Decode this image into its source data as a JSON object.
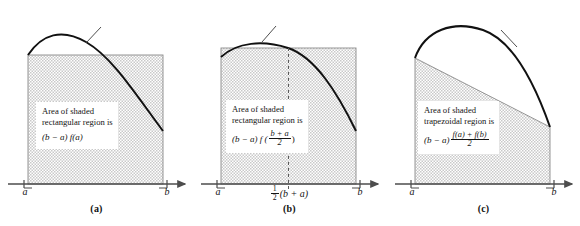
{
  "figure": {
    "curve_label": "y = f(x)",
    "panels": [
      {
        "id": "a",
        "caption": "(a)",
        "method": "left-endpoint rectangle rule",
        "callout": {
          "line1": "Area of shaded",
          "line2": "rectangular region is",
          "formula_text": "(b − a) f(a)",
          "formula": {
            "lead": "(b − a) f(a)"
          }
        },
        "axis_labels": {
          "left": "a",
          "right": "b"
        }
      },
      {
        "id": "b",
        "caption": "(b)",
        "method": "midpoint rectangle rule",
        "callout": {
          "line1": "Area of shaded",
          "line2": "rectangular region is",
          "formula_text": "(b − a) f((b + a)/2)",
          "formula": {
            "lead": "(b − a) f (",
            "numerator": "b + a",
            "denominator": "2",
            "trail": ")"
          }
        },
        "axis_labels": {
          "left": "a",
          "middle_text": "1/2 (b + a)",
          "middle": {
            "numerator": "1",
            "denominator": "2",
            "trail": "(b + a)"
          },
          "right": "b"
        }
      },
      {
        "id": "c",
        "caption": "(c)",
        "method": "trapezoidal rule",
        "callout": {
          "line1": "Area of shaded",
          "line2": "trapezoidal region is",
          "formula_text": "(b − a) (f(a) + f(b))/2",
          "formula": {
            "lead": "(b − a)",
            "numerator": "f(a) + f(b)",
            "denominator": "2"
          }
        },
        "axis_labels": {
          "left": "a",
          "right": "b"
        }
      }
    ]
  },
  "colors": {
    "curve": "#111111",
    "axis": "#4d4d4d",
    "shade_fill": "#d8d8d8",
    "region_outline": "#8a8a8a",
    "background": "#ffffff",
    "text": "#141414"
  }
}
